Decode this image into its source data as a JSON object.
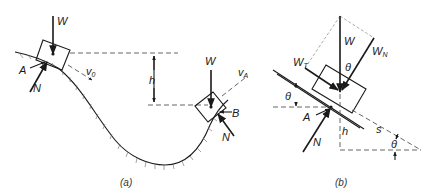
{
  "figure_a": {
    "caption": "(a)",
    "labels": {
      "weight_top": "W",
      "point_a": "A",
      "normal_a": "N",
      "velocity_0": "v",
      "velocity_0_sub": "0",
      "height": "h",
      "weight_b": "W",
      "velocity_a": "v",
      "velocity_a_sub": "A",
      "point_b": "B",
      "normal_b": "N"
    }
  },
  "figure_b": {
    "caption": "(b)",
    "labels": {
      "weight": "W",
      "weight_normal": "W",
      "weight_normal_sub": "N",
      "weight_tangent": "W",
      "weight_tangent_sub": "T",
      "theta_force": "θ",
      "theta_left": "θ",
      "point_a": "A",
      "normal": "N",
      "height": "h",
      "distance": "s",
      "theta_bottom": "θ"
    }
  }
}
